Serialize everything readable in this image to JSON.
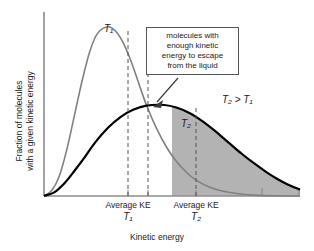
{
  "figure": {
    "width": 314,
    "height": 251,
    "background": "#ffffff"
  },
  "axes": {
    "x_title": "Kinetic energy",
    "y_title_line1": "Fraction of molecules",
    "y_title_line2": "with a given kinetic energy",
    "axis_color": "#8c8c8c"
  },
  "callout": {
    "line1": "molecules with",
    "line2": "enough kinetic",
    "line3": "energy to escape",
    "line4": "from the liquid",
    "border_color": "#555555"
  },
  "annotations": {
    "temp_relation": "T₂ > T₁",
    "curve_label_1": "T₁",
    "curve_label_2": "T₂"
  },
  "tick_labels": [
    {
      "line1": "Average KE",
      "line2": "T₁"
    },
    {
      "line1": "Average KE",
      "line2": "T₂"
    }
  ],
  "chart_data": {
    "type": "line",
    "title": "",
    "xlabel": "Kinetic energy",
    "ylabel": "Fraction of molecules with a given kinetic energy",
    "grid": false,
    "legend": "inline-curve-labels",
    "xlim": [
      0,
      1
    ],
    "ylim": [
      0,
      1
    ],
    "axis_ticks_x_fraction": [
      0.33,
      0.5,
      0.67,
      0.92
    ],
    "shaded_region": {
      "label": "molecules with enough kinetic energy to escape from the liquid",
      "fill_color": "#b3b3b3",
      "under_series": "T2",
      "x_start_fraction": 0.5,
      "x_end_fraction": 1.0
    },
    "series": [
      {
        "name": "T1",
        "color": "#808080",
        "line_width": 1.6,
        "peak_x_fraction": 0.25,
        "peak_y_fraction": 0.93,
        "mean_ke_x_fraction": 0.33,
        "description": "Narrow tall Maxwell-Boltzmann distribution at lower temperature",
        "points": [
          [
            0.0,
            0.0
          ],
          [
            0.03,
            0.03
          ],
          [
            0.06,
            0.11
          ],
          [
            0.09,
            0.26
          ],
          [
            0.12,
            0.45
          ],
          [
            0.15,
            0.64
          ],
          [
            0.18,
            0.8
          ],
          [
            0.21,
            0.895
          ],
          [
            0.25,
            0.93
          ],
          [
            0.28,
            0.905
          ],
          [
            0.31,
            0.84
          ],
          [
            0.34,
            0.74
          ],
          [
            0.37,
            0.62
          ],
          [
            0.4,
            0.5
          ],
          [
            0.44,
            0.37
          ],
          [
            0.48,
            0.265
          ],
          [
            0.52,
            0.185
          ],
          [
            0.56,
            0.125
          ],
          [
            0.6,
            0.082
          ],
          [
            0.65,
            0.047
          ],
          [
            0.7,
            0.026
          ],
          [
            0.76,
            0.012
          ],
          [
            0.82,
            0.005
          ],
          [
            0.9,
            0.001
          ],
          [
            1.0,
            0.0
          ]
        ]
      },
      {
        "name": "T2",
        "color": "#000000",
        "line_width": 2.2,
        "peak_x_fraction": 0.47,
        "peak_y_fraction": 0.5,
        "mean_ke_x_fraction": 0.67,
        "description": "Broad low Maxwell-Boltzmann distribution at higher temperature",
        "points": [
          [
            0.0,
            0.0
          ],
          [
            0.04,
            0.02
          ],
          [
            0.08,
            0.07
          ],
          [
            0.12,
            0.14
          ],
          [
            0.16,
            0.215
          ],
          [
            0.2,
            0.295
          ],
          [
            0.25,
            0.375
          ],
          [
            0.3,
            0.435
          ],
          [
            0.35,
            0.475
          ],
          [
            0.4,
            0.497
          ],
          [
            0.47,
            0.5
          ],
          [
            0.52,
            0.485
          ],
          [
            0.57,
            0.455
          ],
          [
            0.62,
            0.41
          ],
          [
            0.67,
            0.355
          ],
          [
            0.72,
            0.295
          ],
          [
            0.77,
            0.235
          ],
          [
            0.82,
            0.18
          ],
          [
            0.87,
            0.13
          ],
          [
            0.91,
            0.095
          ],
          [
            0.95,
            0.065
          ],
          [
            1.0,
            0.035
          ]
        ]
      }
    ]
  }
}
